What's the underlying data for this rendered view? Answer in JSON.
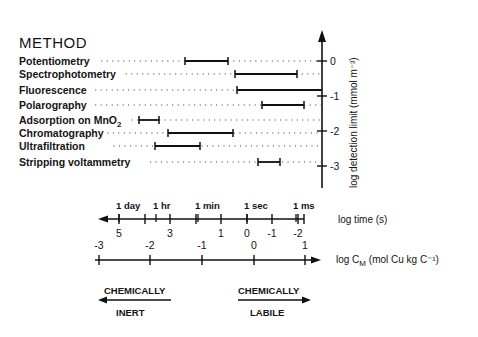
{
  "figure": {
    "heading": "METHOD",
    "y_axis_title": "log detection limit (mmol m⁻³)",
    "time_axis_title": "log time (s)",
    "cm_axis_title_prefix": "log C",
    "cm_axis_title_sub": "M",
    "cm_axis_title_suffix": " (mol Cu kg C⁻¹)",
    "time_markers": [
      {
        "label": "1 day",
        "x": 119
      },
      {
        "label": "1 hr",
        "x": 156
      },
      {
        "label": "1 min",
        "x": 198
      },
      {
        "label": "1 sec",
        "x": 247
      },
      {
        "label": "1 ms",
        "x": 296
      }
    ],
    "bottom_left": {
      "top": "CHEMICALLY",
      "bottom": "INERT"
    },
    "bottom_right": {
      "top": "CHEMICALLY",
      "bottom": "LABILE"
    }
  },
  "chart_data": {
    "type": "range-bar",
    "title": "METHOD",
    "ylabel": "log detection limit (mmol m^-3)",
    "y_ticks": [
      0,
      -1,
      -2,
      -3
    ],
    "xlabel_1": "log time (s)",
    "x1_ticks": [
      5,
      4,
      3,
      2,
      1,
      0,
      -1,
      -2
    ],
    "x1_tick_labels": [
      "5",
      "3",
      "1",
      "0",
      "-1",
      "-2"
    ],
    "x1_markers": [
      "1 day",
      "1 hr",
      "1 min",
      "1 sec",
      "1 ms"
    ],
    "xlabel_2": "log C_M (mol Cu kg C^-1)",
    "x2_ticks": [
      -3,
      -2,
      -1,
      0,
      1
    ],
    "methods": [
      {
        "name": "Potentiometry",
        "log_time_range": [
          2.6,
          0.9
        ],
        "detection_row_level": 0
      },
      {
        "name": "Spectrophotometry",
        "log_time_range": [
          0.5,
          -1.9
        ],
        "detection_row_level": -0.4
      },
      {
        "name": "Fluorescence",
        "log_time_range": [
          0.4,
          -2.9
        ],
        "detection_row_level": -0.8
      },
      {
        "name": "Polarography",
        "log_time_range": [
          -0.6,
          -2.2
        ],
        "detection_row_level": -1.3
      },
      {
        "name": "Adsorption on MnO2",
        "log_time_range": [
          4.3,
          3.5
        ],
        "detection_row_level": -1.7
      },
      {
        "name": "Chromatography",
        "log_time_range": [
          3.1,
          0.6
        ],
        "detection_row_level": -2.1
      },
      {
        "name": "Ultrafiltration",
        "log_time_range": [
          3.6,
          1.8
        ],
        "detection_row_level": -2.4
      },
      {
        "name": "Stripping voltammetry",
        "log_time_range": [
          -0.4,
          -1.3
        ],
        "detection_row_level": -2.9
      }
    ],
    "annotations": [
      "CHEMICALLY INERT (←)",
      "CHEMICALLY LABILE (→)"
    ]
  },
  "layout": {
    "rows": [
      {
        "label": "Potentiometry",
        "label_sub": "",
        "y": 61,
        "x1": 185,
        "x2": 228,
        "left_cap": true,
        "right_cap": true
      },
      {
        "label": "Spectrophotometry",
        "label_sub": "",
        "y": 74,
        "x1": 235,
        "x2": 297,
        "left_cap": true,
        "right_cap": true
      },
      {
        "label": "Fluorescence",
        "label_sub": "",
        "y": 90,
        "x1": 237,
        "x2": 322,
        "left_cap": true,
        "right_cap": false
      },
      {
        "label": "Polarography",
        "label_sub": "",
        "y": 105,
        "x1": 262,
        "x2": 304,
        "left_cap": true,
        "right_cap": true
      },
      {
        "label": "Adsorption on MnO",
        "label_sub": "2",
        "y": 120,
        "x1": 139,
        "x2": 159,
        "left_cap": true,
        "right_cap": true
      },
      {
        "label": "Chromatography",
        "label_sub": "",
        "y": 133,
        "x1": 168,
        "x2": 233,
        "left_cap": true,
        "right_cap": true
      },
      {
        "label": "Ultrafiltration",
        "label_sub": "",
        "y": 146,
        "x1": 155,
        "x2": 200,
        "left_cap": true,
        "right_cap": true
      },
      {
        "label": "Stripping voltammetry",
        "label_sub": "",
        "y": 162,
        "x1": 258,
        "x2": 280,
        "left_cap": true,
        "right_cap": true
      }
    ],
    "y_ticks": [
      {
        "label": "0",
        "y": 61
      },
      {
        "label": "-1",
        "y": 96
      },
      {
        "label": "-2",
        "y": 131
      },
      {
        "label": "-3",
        "y": 166
      }
    ],
    "time_ticks": [
      {
        "label": "5",
        "x": 119
      },
      {
        "label": "",
        "x": 145
      },
      {
        "label": "3",
        "x": 170
      },
      {
        "label": "",
        "x": 196
      },
      {
        "label": "1",
        "x": 221
      },
      {
        "label": "0",
        "x": 247
      },
      {
        "label": "-1",
        "x": 272
      },
      {
        "label": "-2",
        "x": 298
      }
    ],
    "cm_ticks": [
      {
        "label": "-3",
        "x": 99
      },
      {
        "label": "-2",
        "x": 150
      },
      {
        "label": "-1",
        "x": 202
      },
      {
        "label": "0",
        "x": 254
      },
      {
        "label": "1",
        "x": 305
      }
    ]
  }
}
